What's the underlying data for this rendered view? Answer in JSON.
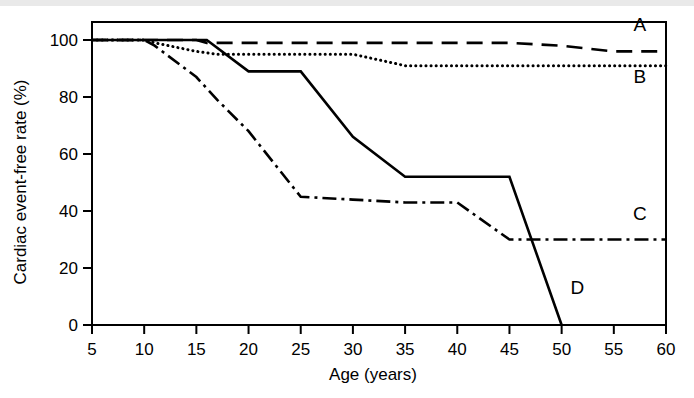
{
  "figure": {
    "background_color": "#ffffff",
    "line_color": "#000000",
    "top_band_color": "#e9e9e9"
  },
  "chart_data": {
    "type": "line",
    "title": "",
    "xlabel": "Age (years)",
    "ylabel": "Cardiac event-free rate (%)",
    "xlim": [
      5,
      60
    ],
    "ylim": [
      0,
      100
    ],
    "xticks": [
      5,
      10,
      15,
      20,
      25,
      30,
      35,
      40,
      45,
      50,
      55,
      60
    ],
    "yticks": [
      0,
      20,
      40,
      60,
      80,
      100
    ],
    "xtick_labels": [
      "5",
      "10",
      "15",
      "20",
      "25",
      "30",
      "35",
      "40",
      "45",
      "50",
      "55",
      "60"
    ],
    "ytick_labels": [
      "0",
      "20",
      "40",
      "60",
      "80",
      "100"
    ],
    "grid": false,
    "legend": "inline-end-labels",
    "series": [
      {
        "name": "A",
        "label": "A",
        "style": "dashed",
        "x": [
          5,
          10,
          15,
          16,
          35,
          45,
          50,
          55,
          60
        ],
        "y": [
          100,
          100,
          100,
          99,
          99,
          99,
          98,
          96,
          96
        ]
      },
      {
        "name": "B",
        "label": "B",
        "style": "dotted",
        "x": [
          5,
          10,
          11,
          15,
          17,
          30,
          35,
          45,
          55,
          60
        ],
        "y": [
          100,
          100,
          99,
          96,
          95,
          95,
          91,
          91,
          91,
          91
        ]
      },
      {
        "name": "C",
        "label": "C",
        "style": "dash-dot",
        "x": [
          5,
          10,
          11,
          15,
          17,
          20,
          25,
          30,
          35,
          40,
          45,
          50,
          55,
          60
        ],
        "y": [
          100,
          100,
          98,
          87,
          79,
          68,
          45,
          44,
          43,
          43,
          30,
          30,
          30,
          30
        ]
      },
      {
        "name": "D",
        "label": "D",
        "style": "solid",
        "x": [
          5,
          10,
          15,
          16,
          20,
          25,
          30,
          35,
          45,
          50
        ],
        "y": [
          100,
          100,
          100,
          100,
          89,
          89,
          66,
          52,
          52,
          0
        ]
      }
    ],
    "series_end_labels": [
      {
        "label": "A",
        "x": 57.5,
        "y": 103
      },
      {
        "label": "B",
        "x": 57.5,
        "y": 85
      },
      {
        "label": "C",
        "x": 57.5,
        "y": 37
      },
      {
        "label": "D",
        "x": 51.5,
        "y": 11
      }
    ]
  }
}
